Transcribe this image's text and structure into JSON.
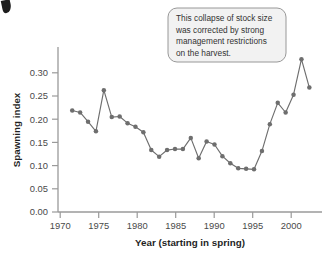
{
  "chart_data": {
    "type": "line",
    "title": "",
    "xlabel": "Year (starting in spring)",
    "ylabel": "Spawning index",
    "xlim": [
      1969.2,
      2002.6
    ],
    "ylim": [
      0.0,
      0.325
    ],
    "xticks": [
      1970,
      1975,
      1980,
      1985,
      1990,
      1995,
      2000
    ],
    "xtick_labels": [
      "1970",
      "1975",
      "1980",
      "1985",
      "1990",
      "1995",
      "2000"
    ],
    "yticks": [
      0.0,
      0.05,
      0.1,
      0.15,
      0.2,
      0.25,
      0.3
    ],
    "ytick_labels": [
      "0.00",
      "0.05",
      "0.10",
      "0.15",
      "0.20",
      "0.25",
      "0.30"
    ],
    "grid": false,
    "legend": false,
    "marker": "filled-circle",
    "series_color": "#6e6e6e",
    "x": [
      1971,
      1972,
      1973,
      1974,
      1975,
      1976,
      1977,
      1978,
      1979,
      1980,
      1981,
      1982,
      1983,
      1984,
      1985,
      1986,
      1987,
      1988,
      1989,
      1990,
      1991,
      1992,
      1993,
      1994,
      1995,
      1996,
      1997,
      1998,
      1999,
      2000,
      2001
    ],
    "values": [
      0.2,
      0.196,
      0.178,
      0.159,
      0.24,
      0.187,
      0.188,
      0.175,
      0.168,
      0.157,
      0.122,
      0.109,
      0.122,
      0.124,
      0.124,
      0.146,
      0.106,
      0.139,
      0.133,
      0.11,
      0.096,
      0.086,
      0.085,
      0.084,
      0.12,
      0.173,
      0.215,
      0.196,
      0.231,
      0.301,
      0.245
    ],
    "annotations": [
      {
        "text": "This collapse of stock size was corrected by strong management restrictions on the harvest.",
        "lines": [
          "This collapse of stock size",
          "was corrected by strong",
          "management restrictions",
          "on the harvest."
        ],
        "points_to_year": 1991,
        "style": "rounded-callout"
      }
    ]
  },
  "colors": {
    "line": "#6e6e6e",
    "marker": "#666666",
    "axis": "#9a9a9a",
    "text": "#333333",
    "callout_fill": "#f2f2f2",
    "callout_border": "#8d8d8d"
  }
}
